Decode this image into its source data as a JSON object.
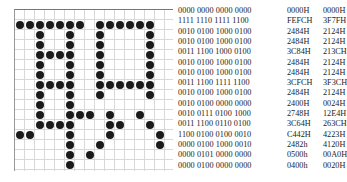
{
  "grid": {
    "cols": 16,
    "rows": 16,
    "bitmap": [
      "0000000000000000",
      "1111111011111100",
      "0010010010000100",
      "0010010010000100",
      "0011110010000100",
      "0010010010000100",
      "0010010010000100",
      "0011110011111100",
      "0010010010000100",
      "0010010000000000",
      "0010011101001000",
      "0011110001100100",
      "1100010001000010",
      "0000010010000010",
      "0000010100000000",
      "0000010000000000"
    ]
  },
  "rows": [
    {
      "bin": "0000  0000  0000 0000",
      "hex1": "0000H",
      "hex2": "0000H"
    },
    {
      "bin": "1111  1110  1111 1100",
      "hex1": "FEFCH",
      "hex2": "3F7FH"
    },
    {
      "bin": "0010  0100  1000 0100",
      "hex1": "2484H",
      "hex2": "2124H"
    },
    {
      "bin": "0010  0100  1000 0100",
      "hex1": "2484H",
      "hex2": "2124H"
    },
    {
      "bin": "0011  1100  1000 0100",
      "hex1": "3C84H",
      "hex2": "213CH"
    },
    {
      "bin": "0010  0100  1000 0100",
      "hex1": "2484H",
      "hex2": "2124H"
    },
    {
      "bin": "0010  0100  1000 0100",
      "hex1": "2484H",
      "hex2": "2124H"
    },
    {
      "bin": "0011  1100  1111 1100",
      "hex1": "3CFCH",
      "hex2": "3F3CH"
    },
    {
      "bin": "0010  0100  1000 0100",
      "hex1": "2484H",
      "hex2": "2124H"
    },
    {
      "bin": "0010  0100  0000 0000",
      "hex1": "2400H",
      "hex2": "0024H"
    },
    {
      "bin": "0010  0111  0100 1000",
      "hex1": "2748H",
      "hex2": "12E4H"
    },
    {
      "bin": "0011  1100  0110 0100",
      "hex1": "3C64H",
      "hex2": "263CH"
    },
    {
      "bin": "1100  0100  0100 0010",
      "hex1": "C442H",
      "hex2": "4223H"
    },
    {
      "bin": "0000  0100  1000 0010",
      "hex1": "2482h",
      "hex2": "4120H"
    },
    {
      "bin": "0000  0101  0000 0000",
      "hex1": "0500h",
      "hex2": "00A0H"
    },
    {
      "bin": "0000  0100  0000 0000",
      "hex1": "0400h",
      "hex2": "0020H"
    }
  ]
}
